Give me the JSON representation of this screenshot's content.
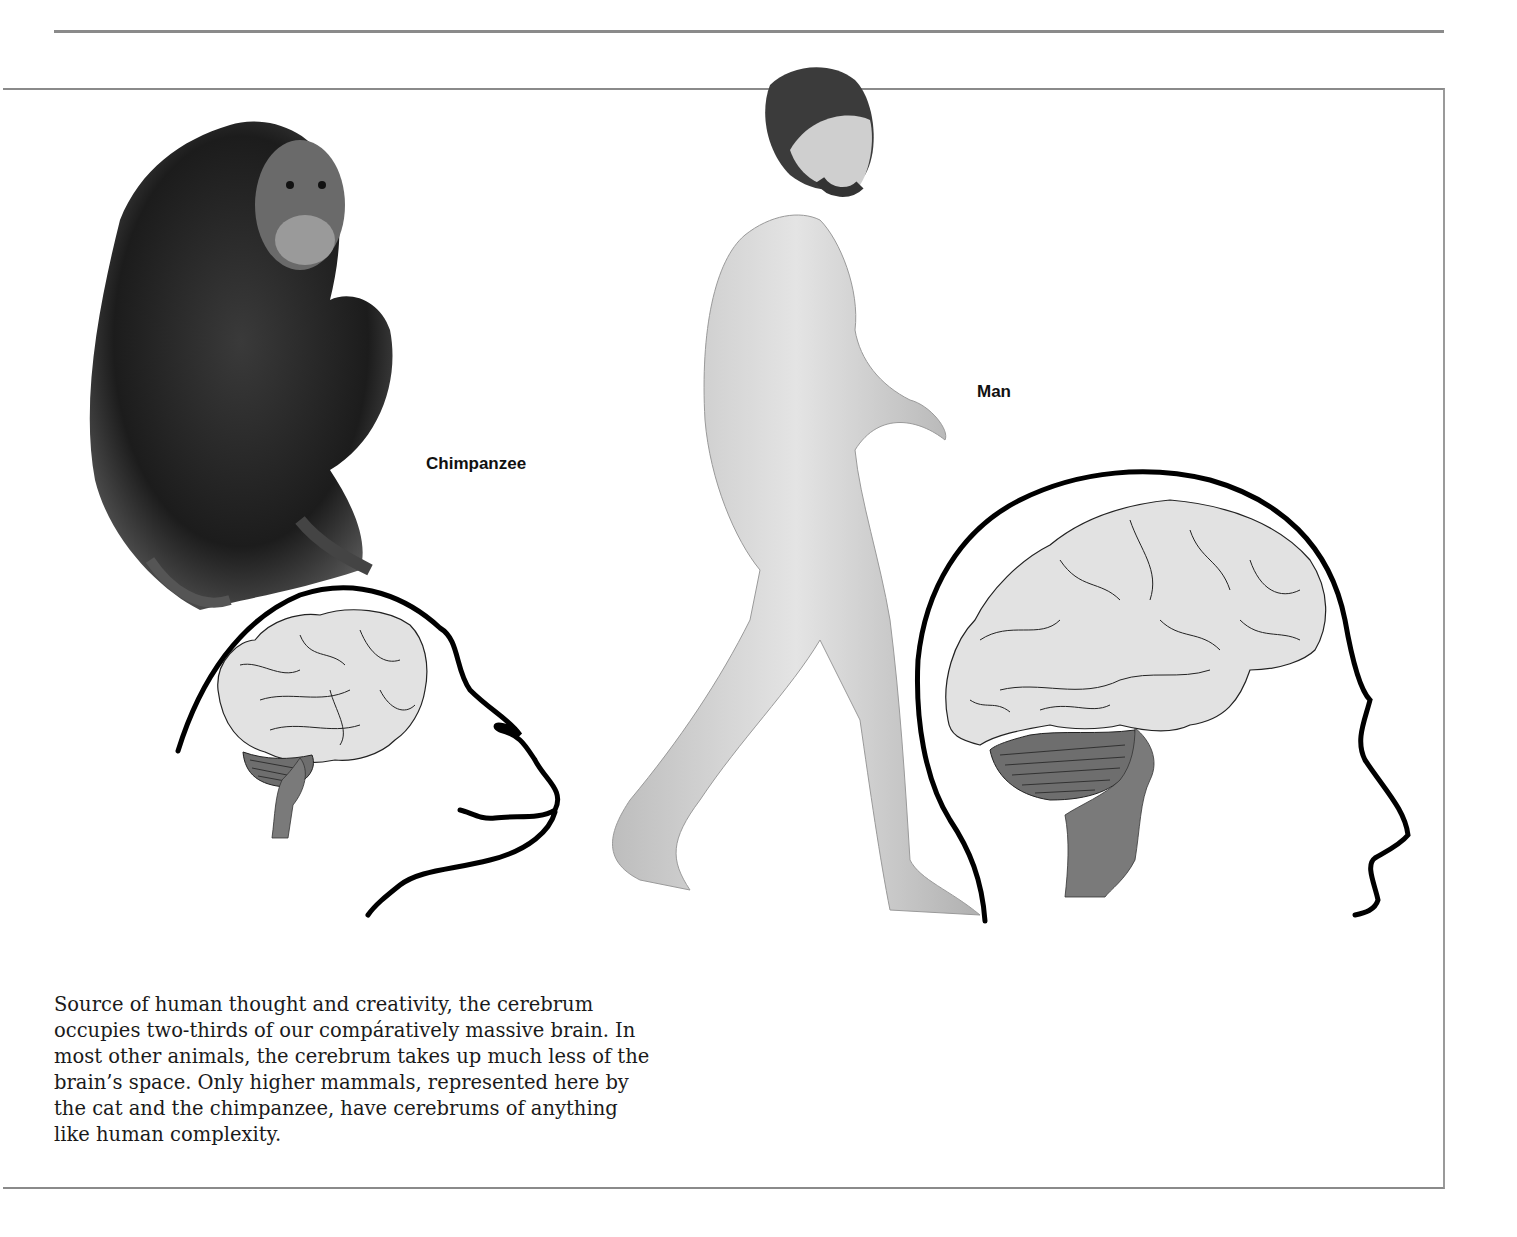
{
  "labels": {
    "chimpanzee": "Chimpanzee",
    "man": "Man"
  },
  "caption": {
    "lines": [
      "Source of human thought and creativity, the cerebrum",
      "occupies two-thirds of our compáratively massive brain. In",
      "most other animals, the cerebrum takes up much less of the",
      "brain’s space. Only higher mammals, represented here by",
      "the cat and the chimpanzee, have cerebrums of anything",
      "like human complexity."
    ]
  },
  "colors": {
    "rule": "#8a8a8a",
    "cerebrum_fill": "#e2e2e2",
    "cerebellum_fill": "#6e6e6e",
    "brainstem_fill": "#7a7a7a",
    "outline": "#000000"
  }
}
